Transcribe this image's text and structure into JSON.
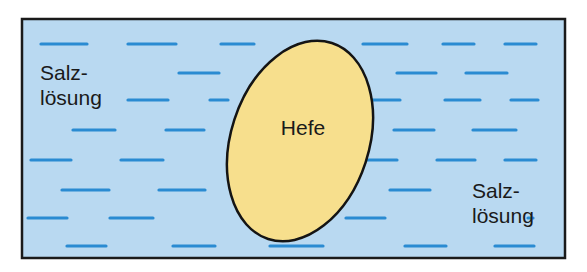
{
  "figure": {
    "width": 587,
    "height": 272,
    "frame": {
      "x": 22,
      "y": 19,
      "width": 543,
      "height": 239,
      "stroke": "#1a1a1a",
      "stroke_width": 2.5
    },
    "colors": {
      "solution": "#b9d9f1",
      "cell_fill": "#f7df8d",
      "cell_stroke": "#141414",
      "dash": "#2a8bd2",
      "text": "#1a1a1a"
    }
  },
  "cell": {
    "label": "Hefe",
    "label_x": 303,
    "label_y": 135,
    "cx": 300,
    "cy": 141,
    "rx": 69,
    "ry": 103,
    "rotation": 18
  },
  "labels": {
    "left": {
      "line1": "Salz-",
      "line2": "lösung",
      "x": 40,
      "y1": 80,
      "y2": 105
    },
    "right": {
      "line1": "Salz-",
      "line2": "lösung",
      "x": 472,
      "y1": 198,
      "y2": 223
    }
  },
  "dashes": [
    [
      41,
      44,
      87
    ],
    [
      128,
      44,
      176
    ],
    [
      221,
      44,
      254
    ],
    [
      363,
      44,
      407
    ],
    [
      443,
      44,
      474
    ],
    [
      505,
      44,
      536
    ],
    [
      179,
      73,
      219
    ],
    [
      397,
      73,
      436
    ],
    [
      466,
      73,
      507
    ],
    [
      128,
      100,
      168
    ],
    [
      210,
      100,
      228
    ],
    [
      363,
      100,
      400
    ],
    [
      445,
      100,
      480
    ],
    [
      511,
      100,
      538
    ],
    [
      73,
      130,
      115
    ],
    [
      166,
      130,
      204
    ],
    [
      394,
      130,
      434
    ],
    [
      473,
      130,
      516
    ],
    [
      31,
      160,
      71
    ],
    [
      121,
      160,
      163
    ],
    [
      363,
      160,
      397
    ],
    [
      437,
      160,
      475
    ],
    [
      505,
      160,
      536
    ],
    [
      62,
      190,
      109
    ],
    [
      159,
      190,
      205
    ],
    [
      390,
      190,
      430
    ],
    [
      28,
      218,
      67
    ],
    [
      110,
      218,
      153
    ],
    [
      346,
      218,
      385
    ],
    [
      528,
      218,
      533
    ],
    [
      67,
      246,
      106
    ],
    [
      173,
      246,
      215
    ],
    [
      270,
      246,
      323
    ],
    [
      405,
      246,
      446
    ],
    [
      495,
      246,
      534
    ]
  ]
}
